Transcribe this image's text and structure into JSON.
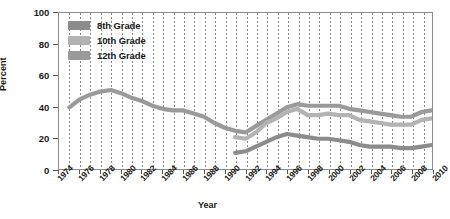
{
  "chart_data": {
    "type": "line",
    "title": "",
    "xlabel": "Year",
    "ylabel": "Percent",
    "xlim": [
      1974,
      2010
    ],
    "ylim": [
      0,
      100
    ],
    "ytick_labels": [
      "0",
      "20",
      "40",
      "60",
      "80",
      "100"
    ],
    "ytick_values": [
      0,
      20,
      40,
      60,
      80,
      100
    ],
    "xtick_labels": [
      "1974",
      "1976",
      "1978",
      "1980",
      "1982",
      "1984",
      "1986",
      "1988",
      "1990",
      "1992",
      "1994",
      "1996",
      "1998",
      "2000",
      "2002",
      "2004",
      "2006",
      "2008",
      "2010"
    ],
    "xtick_values": [
      1974,
      1976,
      1978,
      1980,
      1982,
      1984,
      1986,
      1988,
      1990,
      1992,
      1994,
      1996,
      1998,
      2000,
      2002,
      2004,
      2006,
      2008,
      2010
    ],
    "grid": "vertical-dotted-yearly",
    "legend_position": "top-left",
    "series": [
      {
        "name": "8th Grade",
        "color": "#8c8c8c",
        "x": [
          1991,
          1992,
          1993,
          1994,
          1995,
          1996,
          1997,
          1998,
          1999,
          2000,
          2001,
          2002,
          2003,
          2004,
          2005,
          2006,
          2007,
          2008,
          2009,
          2010
        ],
        "values": [
          11,
          12,
          15,
          18,
          21,
          23,
          22,
          21,
          20,
          20,
          19,
          18,
          16,
          15,
          15,
          15,
          14,
          14,
          15,
          16
        ]
      },
      {
        "name": "10th Grade",
        "color": "#b3b3b3",
        "x": [
          1991,
          1992,
          1993,
          1994,
          1995,
          1996,
          1997,
          1998,
          1999,
          2000,
          2001,
          2002,
          2003,
          2004,
          2005,
          2006,
          2007,
          2008,
          2009,
          2010
        ],
        "values": [
          21,
          20,
          24,
          30,
          33,
          37,
          39,
          35,
          35,
          36,
          35,
          35,
          32,
          31,
          30,
          29,
          29,
          29,
          32,
          33
        ]
      },
      {
        "name": "12th Grade",
        "color": "#9a9a9a",
        "x": [
          1975,
          1976,
          1977,
          1978,
          1979,
          1980,
          1981,
          1982,
          1983,
          1984,
          1985,
          1986,
          1987,
          1988,
          1989,
          1990,
          1991,
          1992,
          1993,
          1994,
          1995,
          1996,
          1997,
          1998,
          1999,
          2000,
          2001,
          2002,
          2003,
          2004,
          2005,
          2006,
          2007,
          2008,
          2009,
          2010
        ],
        "values": [
          40,
          45,
          48,
          50,
          51,
          49,
          46,
          44,
          41,
          39,
          38,
          38,
          36,
          34,
          30,
          27,
          25,
          24,
          28,
          32,
          36,
          40,
          42,
          41,
          41,
          41,
          41,
          39,
          38,
          37,
          36,
          35,
          34,
          34,
          37,
          38
        ]
      }
    ]
  },
  "legend": {
    "items": [
      {
        "label": "8th Grade"
      },
      {
        "label": "10th Grade"
      },
      {
        "label": "12th Grade"
      }
    ]
  },
  "axis": {
    "x_title": "Year",
    "y_title": "Percent"
  }
}
